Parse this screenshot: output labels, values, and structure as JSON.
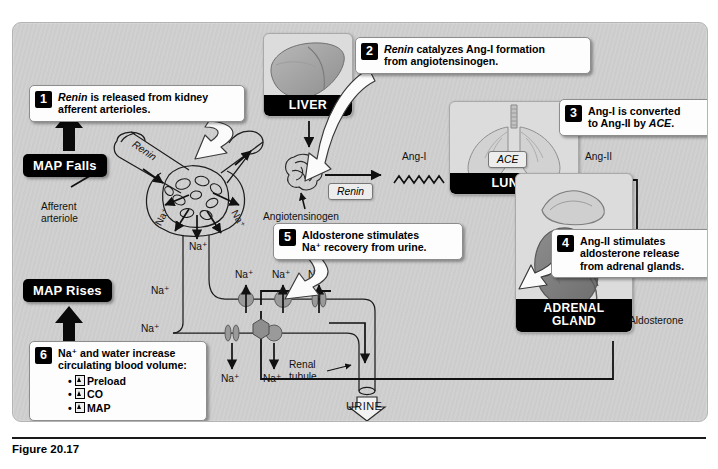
{
  "figure": {
    "caption": "Figure 20.17"
  },
  "callouts": [
    {
      "number": "1",
      "line1_em": "Renin",
      "line1_rest": " is released from kidney",
      "line2": "afferent arterioles."
    },
    {
      "number": "2",
      "line1_em": "Renin",
      "line1_rest": " catalyzes Ang-I formation",
      "line2": "from angiotensinogen."
    },
    {
      "number": "3",
      "line1": "Ang-I is converted",
      "line2_pre": "to Ang-II by ",
      "line2_em": "ACE",
      "line2_post": "."
    },
    {
      "number": "4",
      "line1": "Ang-II stimulates",
      "line2": "aldosterone release",
      "line3": "from adrenal glands."
    },
    {
      "number": "5",
      "line1": "Aldosterone stimulates",
      "line2": "Na⁺ recovery from urine."
    },
    {
      "number": "6",
      "line1": "Na⁺ and water increase",
      "line2": "circulating blood volume:",
      "bullets": [
        "Preload",
        "CO",
        "MAP"
      ],
      "bullet_arrow": "up-arrow"
    }
  ],
  "pills": {
    "map_falls": "MAP Falls",
    "map_rises": "MAP Rises"
  },
  "organs": [
    {
      "name": "liver",
      "caption": "LIVER"
    },
    {
      "name": "lungs",
      "caption": "LUNGS"
    },
    {
      "name": "adrenal-gland",
      "caption_line1": "ADRENAL",
      "caption_line2": "GLAND"
    }
  ],
  "enzymes": {
    "renin": "Renin",
    "ace": "ACE"
  },
  "labels": {
    "renin_vessel": "Renin",
    "afferent_arteriole_l1": "Afferent",
    "afferent_arteriole_l2": "arteriole",
    "angiotensinogen": "Angiotensinogen",
    "ang_i": "Ang-I",
    "ang_ii_lungs": "Ang-II",
    "ang_ii_adrenal": "Ang-II",
    "aldosterone": "Aldosterone",
    "renal_tubule_l1": "Renal",
    "renal_tubule_l2": "tubule",
    "urine": "URINE",
    "sodium": "Na⁺"
  },
  "sodium_labels": {
    "glomerulus": [
      "Na⁺",
      "Na⁺",
      "Na⁺"
    ],
    "descending": [
      "Na⁺",
      "Na⁺"
    ],
    "tubule_top": [
      "Na⁺",
      "Na⁺",
      "Na⁺"
    ],
    "tubule_bottom": [
      "Na⁺",
      "Na⁺"
    ]
  },
  "colors": {
    "panel_background": "#cfcfcf",
    "callout_background": "#fdfdfd",
    "badge_black": "#000000",
    "organ_panel": "#dcdcdc",
    "transporter_gray": "#9a9a9a",
    "hexagon_gray": "#8e8e8e",
    "caption_text": "#000000"
  }
}
